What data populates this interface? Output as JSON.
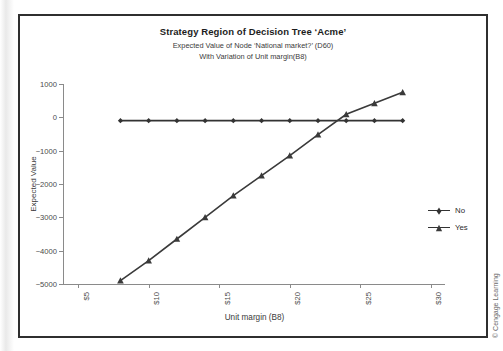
{
  "chart_data": {
    "type": "line",
    "title": "Strategy Region of Decision Tree ‘Acme’",
    "subtitle_1": "Expected Value of Node ‘National market?’ (D60)",
    "subtitle_2": "With Variation of Unit margin(B8)",
    "xlabel": "Unit margin (B8)",
    "ylabel": "Expected Value",
    "x": [
      8,
      10,
      12,
      14,
      16,
      18,
      20,
      22,
      24,
      26,
      28
    ],
    "xtick_labels": [
      "$5",
      "$10",
      "$15",
      "$20",
      "$25",
      "$30"
    ],
    "xtick_values": [
      5,
      10,
      15,
      20,
      25,
      30
    ],
    "ytick_labels": [
      "1000",
      "0",
      "−1000",
      "−2000",
      "−3000",
      "−4000",
      "−5000"
    ],
    "ytick_values": [
      1000,
      0,
      -1000,
      -2000,
      -3000,
      -4000,
      -5000
    ],
    "xlim": [
      4,
      31
    ],
    "ylim": [
      -5000,
      1000
    ],
    "grid": false,
    "legend_position": "right",
    "series": [
      {
        "name": "No",
        "marker": "diamond",
        "color": "#333333",
        "values": [
          -100,
          -100,
          -100,
          -100,
          -100,
          -100,
          -100,
          -100,
          -100,
          -100,
          -100
        ]
      },
      {
        "name": "Yes",
        "marker": "triangle",
        "color": "#3a3a3a",
        "values": [
          -4900,
          -4300,
          -3650,
          -3000,
          -2350,
          -1750,
          -1150,
          -520,
          90,
          420,
          750
        ]
      }
    ]
  },
  "legend": {
    "items": [
      {
        "label": "No"
      },
      {
        "label": "Yes"
      }
    ]
  },
  "footer": {
    "copyright": "© Cengage Learning"
  },
  "colors": {
    "frame": "#2f2f2f",
    "axis": "#8a8a8a",
    "series_no": "#333333",
    "series_yes": "#3a3a3a",
    "text": "#3a3a3a"
  }
}
